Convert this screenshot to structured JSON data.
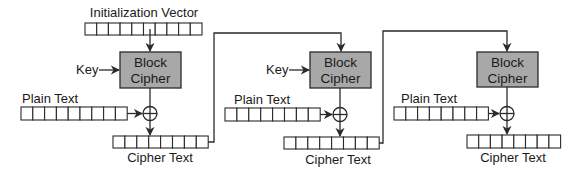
{
  "diagram": {
    "colors": {
      "block_fill": "#a8a8a8",
      "stroke": "#2a2a2a",
      "background": "#ffffff"
    },
    "iv": {
      "label": "Initialization Vector",
      "cells": 10
    },
    "stages": [
      {
        "block_label_line1": "Block",
        "block_label_line2": "Cipher",
        "key_label": "Key",
        "plain_label": "Plain Text",
        "plain_cells": 9,
        "cipher_label": "Cipher Text",
        "cipher_cells": 8,
        "xor_symbol": "⊕"
      },
      {
        "block_label_line1": "Block",
        "block_label_line2": "Cipher",
        "key_label": "Key",
        "plain_label": "Plain Text",
        "plain_cells": 8,
        "cipher_label": "Cipher Text",
        "cipher_cells": 8,
        "xor_symbol": "⊕"
      },
      {
        "block_label_line1": "Block",
        "block_label_line2": "Cipher",
        "key_label": "",
        "plain_label": "Plain Text",
        "plain_cells": 8,
        "cipher_label": "Cipher Text",
        "cipher_cells": 8,
        "xor_symbol": "⊕"
      }
    ]
  }
}
